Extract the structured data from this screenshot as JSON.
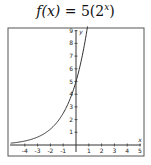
{
  "chart_data": {
    "type": "line",
    "title_parts": {
      "fx": "f(x)",
      "eq": " = 5(2",
      "exp": "x",
      "close": ")"
    },
    "xlabel": "x",
    "ylabel": "y",
    "xlim": [
      -5,
      5
    ],
    "ylim": [
      0,
      9
    ],
    "x_ticks": [
      -4,
      -3,
      -2,
      -1,
      1,
      2,
      3,
      4,
      5
    ],
    "y_ticks": [
      1,
      2,
      3,
      4,
      5,
      6,
      7,
      8,
      9
    ],
    "grid": false,
    "series": [
      {
        "name": "f(x) = 5(2^x)",
        "x": [
          -5,
          -4,
          -3,
          -2,
          -1,
          0,
          0.5,
          0.85
        ],
        "y": [
          0.16,
          0.31,
          0.63,
          1.25,
          2.5,
          5,
          7.07,
          9
        ]
      }
    ],
    "line_color": "#333333",
    "frame_color": "#555555"
  }
}
